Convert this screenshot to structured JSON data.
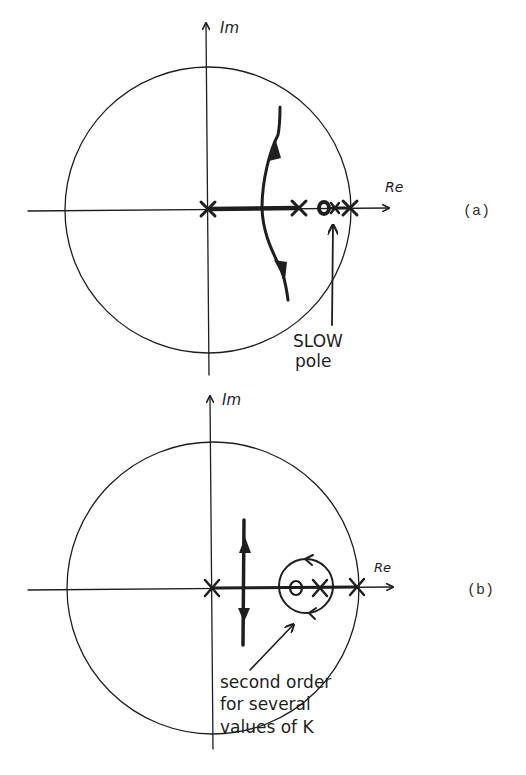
{
  "figure": {
    "panels": [
      {
        "id": "a",
        "label": "(a)",
        "axis_im_label": "Im",
        "axis_re_label": "Re",
        "origin": [
          208,
          210
        ],
        "unit_circle_radius": 143,
        "poles_x": [
          208,
          299,
          350
        ],
        "zeros_x": [
          325
        ],
        "annotation": {
          "lines": [
            "SLOW",
            "pole"
          ],
          "target": "zero-pole pair near unit circle"
        },
        "branches": "real-axis locus from origin pole to second pole; complex branch crossing near Re≈262 moving up and down"
      },
      {
        "id": "b",
        "label": "(b)",
        "axis_im_label": "Im",
        "axis_re_label": "Re",
        "origin": [
          212,
          589
        ],
        "unit_circle_radius": 146,
        "poles_x": [
          212,
          320,
          357
        ],
        "zeros_x": [
          296
        ],
        "annotation": {
          "lines": [
            "second order",
            "for several",
            "values of K"
          ],
          "target": "circular locus around zero"
        },
        "branches": "vertical branch at Re≈245 moving up and down; circular locus around zero/pole pair"
      }
    ],
    "colors": {
      "ink": "#1e1e1e",
      "background": "#ffffff",
      "label": "#333333"
    }
  }
}
